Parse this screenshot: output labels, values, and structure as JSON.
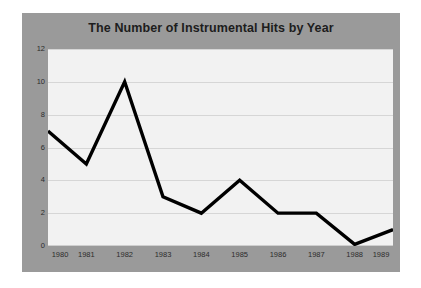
{
  "chart_data": {
    "type": "line",
    "title": "The Number of Instrumental Hits by Year",
    "xlabel": "",
    "ylabel": "",
    "categories": [
      "1980",
      "1981",
      "1982",
      "1983",
      "1984",
      "1985",
      "1986",
      "1987",
      "1988",
      "1989"
    ],
    "values": [
      7,
      5,
      10,
      3,
      2,
      4,
      2,
      2,
      0,
      1
    ],
    "series": [
      {
        "name": "Number of Instrumental Hits",
        "values": [
          7,
          5,
          10,
          3,
          2,
          4,
          2,
          2,
          0,
          1
        ]
      }
    ],
    "ylim": [
      0,
      12
    ],
    "yticks": [
      "0",
      "2",
      "4",
      "6",
      "8",
      "10",
      "12"
    ],
    "ytick_values": [
      0,
      2,
      4,
      6,
      8,
      10,
      12
    ],
    "xticks": [
      "1980",
      "1981",
      "1982",
      "1983",
      "1984",
      "1985",
      "1986",
      "1987",
      "1988",
      "1989"
    ],
    "grid": "horizontal",
    "legend": "none",
    "markers": "none",
    "colors": {
      "line": "#000000",
      "panel_background": "#9a9a9a",
      "plot_background": "#f2f2f2",
      "gridline": "#d6d6d6",
      "title_text": "#1d1d1d",
      "tick_text": "#2c2c2c",
      "page_background": "#ffffff"
    }
  }
}
